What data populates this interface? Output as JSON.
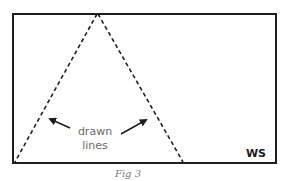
{
  "figure": {
    "caption": "Fig 3",
    "corner_label": "WS",
    "annotation": {
      "line1": "drawn",
      "line2": "lines"
    },
    "colors": {
      "frame": "#1e1e1e",
      "dashed_lines": "#1e1e1e",
      "annotation_text": "#6a6a6a",
      "caption_text": "#7a7a7a"
    }
  }
}
